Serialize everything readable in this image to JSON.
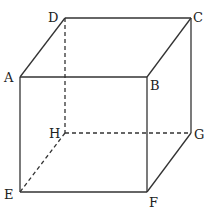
{
  "diagram": {
    "type": "cube",
    "vertices": {
      "A": {
        "label": "A",
        "x": 20,
        "y": 77
      },
      "B": {
        "label": "B",
        "x": 147,
        "y": 77
      },
      "C": {
        "label": "C",
        "x": 191,
        "y": 18
      },
      "D": {
        "label": "D",
        "x": 65,
        "y": 18
      },
      "E": {
        "label": "E",
        "x": 20,
        "y": 192
      },
      "F": {
        "label": "F",
        "x": 147,
        "y": 192
      },
      "G": {
        "label": "G",
        "x": 191,
        "y": 133
      },
      "H": {
        "label": "H",
        "x": 65,
        "y": 133
      }
    },
    "visible_edges": [
      "AB",
      "BC",
      "CD",
      "DA",
      "AE",
      "BF",
      "CG",
      "EF",
      "FG"
    ],
    "hidden_edges": [
      "DH",
      "EH",
      "HG"
    ],
    "colors": {
      "line": "#333333",
      "text": "#222222",
      "background": "#ffffff"
    }
  }
}
